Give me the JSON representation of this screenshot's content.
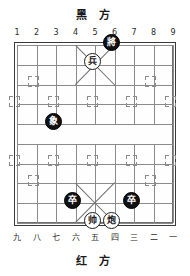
{
  "board": {
    "top_label": "黑 方",
    "bottom_label": "红 方",
    "top_coords": [
      "1",
      "2",
      "3",
      "4",
      "5",
      "6",
      "7",
      "8",
      "9"
    ],
    "bottom_coords": [
      "九",
      "八",
      "七",
      "六",
      "五",
      "四",
      "三",
      "二",
      "一"
    ],
    "columns": 9,
    "rows": 10,
    "colors": {
      "outer_frame": "#3b3b3b",
      "inner_frame": "#6f6f6f",
      "grid_line": "#8a8a8a",
      "black_piece_bg": "#111111",
      "black_piece_fg": "#ffffff",
      "red_piece_bg": "#ffffff",
      "red_piece_fg": "#1a1a1a",
      "background": "#ffffff"
    }
  },
  "pieces": [
    {
      "label": "將",
      "side": "black",
      "col": 6,
      "row": 0,
      "name": "black-general"
    },
    {
      "label": "兵",
      "side": "red",
      "col": 5,
      "row": 1,
      "name": "red-soldier-palace"
    },
    {
      "label": "象",
      "side": "black",
      "col": 3,
      "row": 4,
      "name": "black-elephant"
    },
    {
      "label": "卒",
      "side": "black",
      "col": 4,
      "row": 8,
      "name": "black-pawn-left"
    },
    {
      "label": "卒",
      "side": "black",
      "col": 7,
      "row": 8,
      "name": "black-pawn-right"
    },
    {
      "label": "帅",
      "side": "red",
      "col": 5,
      "row": 9,
      "name": "red-marshal"
    },
    {
      "label": "炮",
      "side": "red",
      "col": 6,
      "row": 9,
      "name": "red-cannon"
    }
  ],
  "markers": {
    "cannon_points": [
      {
        "col": 2,
        "row": 2
      },
      {
        "col": 8,
        "row": 2
      },
      {
        "col": 2,
        "row": 7
      },
      {
        "col": 8,
        "row": 7
      }
    ],
    "pawn_points": [
      {
        "col": 1,
        "row": 3
      },
      {
        "col": 3,
        "row": 3
      },
      {
        "col": 5,
        "row": 3
      },
      {
        "col": 7,
        "row": 3
      },
      {
        "col": 9,
        "row": 3
      },
      {
        "col": 1,
        "row": 6
      },
      {
        "col": 3,
        "row": 6
      },
      {
        "col": 5,
        "row": 6
      },
      {
        "col": 7,
        "row": 6
      },
      {
        "col": 9,
        "row": 6
      }
    ]
  }
}
